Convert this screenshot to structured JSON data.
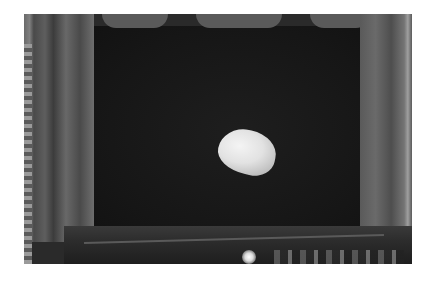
{
  "image": {
    "description": "Grayscale photograph of a theater stage with an image of the Earth (Earthrise) projected on a dark screen, framed by curtains, with stage edge and audience silhouettes at the bottom",
    "subject": "Earth projected on theater screen",
    "palette": {
      "background": "#ffffff",
      "screen": "#161616",
      "curtain": "#5e5e5e",
      "earth": "#e8e8e8"
    }
  }
}
